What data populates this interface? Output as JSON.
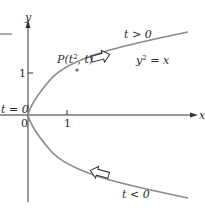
{
  "diagram": {
    "curve_equation": "y² = x",
    "curve_label_base": "y",
    "curve_label_sup": "2",
    "curve_label_rest": " = x",
    "point_label": "P(t², t)",
    "point_label_prefix": "P(t",
    "point_label_sup": "2",
    "point_label_suffix": ", t)",
    "upper_branch_label": "t > 0",
    "lower_branch_label": "t < 0",
    "origin_param_label": "t = 0",
    "origin_label": "0",
    "x_axis_label": "x",
    "y_axis_label": "y",
    "x_tick_label": "1",
    "y_tick_label": "1",
    "colors": {
      "curve": "#8a8a8a",
      "axis": "#333333",
      "text": "#2a2a2a",
      "arrow_fill": "#ffffff"
    }
  }
}
